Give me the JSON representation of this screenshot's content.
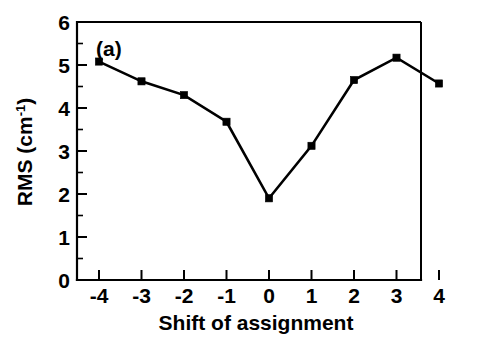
{
  "figure": {
    "panel_label": "(a)",
    "background_color": "#ffffff",
    "line_color": "#000000",
    "marker_color": "#000000"
  },
  "chart_data": {
    "type": "line",
    "title": "",
    "subtitle": "",
    "xlabel": "Shift of assignment",
    "ylabel": "RMS (cm-1)",
    "ylabel_base": "RMS (cm",
    "ylabel_exponent": "-1",
    "ylabel_close": ")",
    "x": [
      -4,
      -3,
      -2,
      -1,
      0,
      1,
      2,
      3,
      4
    ],
    "values": [
      5.08,
      4.62,
      4.3,
      3.68,
      1.9,
      3.12,
      4.65,
      5.17,
      4.57
    ],
    "series": [
      {
        "name": "RMS",
        "marker": "square",
        "values": [
          5.08,
          4.62,
          4.3,
          3.68,
          1.9,
          3.12,
          4.65,
          5.17,
          4.57
        ]
      }
    ],
    "xlim": [
      -4.6,
      4.6
    ],
    "ylim": [
      0,
      6
    ],
    "xticks": [
      -4,
      -3,
      -2,
      -1,
      0,
      1,
      2,
      3,
      4
    ],
    "xtick_labels": [
      "-4",
      "-3",
      "-2",
      "-1",
      "0",
      "1",
      "2",
      "3",
      "4"
    ],
    "yticks": [
      0,
      1,
      2,
      3,
      4,
      5,
      6
    ],
    "ytick_labels": [
      "0",
      "1",
      "2",
      "3",
      "4",
      "5",
      "6"
    ],
    "y_minor_ticks": [
      0.5,
      1.5,
      2.5,
      3.5,
      4.5,
      5.5
    ],
    "grid": false,
    "legend": null,
    "legend_position": "none",
    "annotations": [
      {
        "text": "(a)",
        "x": -4.25,
        "y": 5.65
      }
    ]
  }
}
